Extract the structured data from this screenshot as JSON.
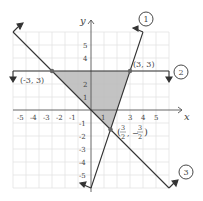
{
  "diagram": {
    "axes": {
      "x_label": "x",
      "y_label": "y"
    },
    "x_ticks": [
      "-5",
      "-4",
      "-3",
      "-2",
      "-1",
      "1",
      "3",
      "4",
      "5"
    ],
    "y_ticks_pos": [
      "1",
      "2",
      "4",
      "5"
    ],
    "y_ticks_neg": [
      "-1",
      "-2",
      "-3",
      "-4",
      "-5"
    ],
    "points": [
      {
        "label": "(-3, 3)"
      },
      {
        "label": "(3, 3)"
      },
      {
        "label_num1": "3",
        "label_den1": "2",
        "label_num2": "3",
        "label_den2": "2"
      }
    ],
    "lines": [
      {
        "id": "1",
        "label": "1"
      },
      {
        "id": "2",
        "label": "2"
      },
      {
        "id": "3",
        "label": "3"
      }
    ],
    "colors": {
      "shade": "#b8b8b8",
      "line": "#333333",
      "grid": "#dddddd",
      "point": "#666666"
    }
  }
}
